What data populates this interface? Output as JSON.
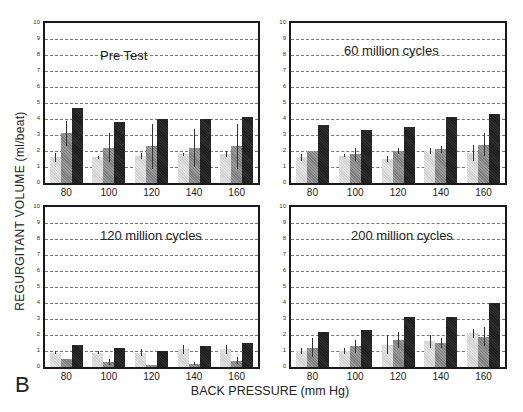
{
  "figure": {
    "panel_letter": "B",
    "ylabel": "REGURGITANT VOLUME (ml/beat)",
    "xlabel": "BACK PRESSURE (mm Hg)",
    "legend": [
      {
        "label": "V.close",
        "color": "#d8d8d8"
      },
      {
        "label": "V.Leak",
        "color": "#8c8c8c"
      },
      {
        "label": "Total Regurgitation",
        "color": "#222222"
      }
    ],
    "y_ticks": [
      "0",
      "1",
      "2",
      "3",
      "4",
      "5",
      "6",
      "7",
      "8",
      "9",
      "10"
    ],
    "x_ticks": [
      "80",
      "100",
      "120",
      "140",
      "160"
    ]
  },
  "chart_data": [
    {
      "type": "bar",
      "title": "Pre Test",
      "categories": [
        "80",
        "100",
        "120",
        "140",
        "160"
      ],
      "xlabel": "BACK PRESSURE (mm Hg)",
      "ylabel": "REGURGITANT VOLUME (ml/beat)",
      "ylim": [
        0,
        10
      ],
      "grid": true,
      "legend_position": "top-right",
      "series": [
        {
          "name": "V.close",
          "values": [
            1.6,
            1.6,
            1.7,
            1.8,
            1.8
          ],
          "errors": [
            0.3,
            0.1,
            0.2,
            0.1,
            0.2
          ]
        },
        {
          "name": "V.Leak",
          "values": [
            3.1,
            2.2,
            2.3,
            2.2,
            2.3
          ],
          "errors": [
            0.8,
            0.9,
            1.4,
            1.2,
            1.4
          ]
        },
        {
          "name": "Total Regurgitation",
          "values": [
            4.7,
            3.8,
            4.0,
            4.0,
            4.1
          ],
          "errors": [
            0,
            0,
            0,
            0,
            0
          ]
        }
      ]
    },
    {
      "type": "bar",
      "title": "60 million cycles",
      "categories": [
        "80",
        "100",
        "120",
        "140",
        "160"
      ],
      "ylim": [
        0,
        10
      ],
      "grid": true,
      "series": [
        {
          "name": "V.close",
          "values": [
            1.6,
            1.7,
            1.5,
            2.0,
            1.9
          ],
          "errors": [
            0.2,
            0.1,
            0.2,
            0.2,
            0.5
          ]
        },
        {
          "name": "V.Leak",
          "values": [
            2.0,
            1.8,
            2.0,
            2.1,
            2.4
          ],
          "errors": [
            0,
            0.4,
            0.2,
            0.2,
            0.7
          ]
        },
        {
          "name": "Total Regurgitation",
          "values": [
            3.6,
            3.3,
            3.5,
            4.1,
            4.3
          ],
          "errors": [
            0,
            0,
            0,
            0,
            0
          ]
        }
      ]
    },
    {
      "type": "bar",
      "title": "120 million cycles",
      "categories": [
        "80",
        "100",
        "120",
        "140",
        "160"
      ],
      "ylim": [
        0,
        10
      ],
      "grid": true,
      "series": [
        {
          "name": "V.close",
          "values": [
            0.9,
            0.9,
            0.9,
            1.1,
            1.1
          ],
          "errors": [
            0.1,
            0.1,
            0.2,
            0.3,
            0.3
          ]
        },
        {
          "name": "V.Leak",
          "values": [
            0.5,
            0.3,
            0.1,
            0.2,
            0.4
          ],
          "errors": [
            0,
            0.2,
            0,
            0.1,
            0.2
          ]
        },
        {
          "name": "Total Regurgitation",
          "values": [
            1.4,
            1.2,
            1.0,
            1.3,
            1.5
          ],
          "errors": [
            0,
            0,
            0,
            0,
            0
          ]
        }
      ]
    },
    {
      "type": "bar",
      "title": "200 million cycles",
      "categories": [
        "80",
        "100",
        "120",
        "140",
        "160"
      ],
      "ylim": [
        0,
        10
      ],
      "grid": true,
      "series": [
        {
          "name": "V.close",
          "values": [
            1.0,
            1.0,
            1.4,
            1.6,
            2.1
          ],
          "errors": [
            0.2,
            0.2,
            0.6,
            0.4,
            0.3
          ]
        },
        {
          "name": "V.Leak",
          "values": [
            1.2,
            1.3,
            1.7,
            1.5,
            1.9
          ],
          "errors": [
            0.6,
            0.4,
            0.5,
            0.3,
            0.6
          ]
        },
        {
          "name": "Total Regurgitation",
          "values": [
            2.2,
            2.3,
            3.1,
            3.1,
            4.0
          ],
          "errors": [
            0,
            0,
            0,
            0,
            0
          ]
        }
      ]
    }
  ]
}
